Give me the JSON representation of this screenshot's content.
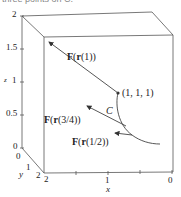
{
  "caption": "three points on C.",
  "axes": {
    "z": {
      "label": "z",
      "ticks": [
        "2",
        "1.5",
        "1",
        "0.5",
        "0"
      ]
    },
    "y": {
      "label": "y",
      "ticks": [
        "0",
        "1",
        "2"
      ]
    },
    "x": {
      "label": "x",
      "ticks": [
        "2",
        "1",
        "0"
      ]
    }
  },
  "curve": {
    "label": "C"
  },
  "point": {
    "label": "(1, 1, 1)"
  },
  "vectors": [
    {
      "F": "F",
      "r": "r",
      "arg": "(1)"
    },
    {
      "F": "F",
      "r": "r",
      "arg": "(3/4)"
    },
    {
      "F": "F",
      "r": "r",
      "arg": "(1/2)"
    }
  ],
  "colors": {
    "line": "#444444",
    "text": "#222222"
  }
}
